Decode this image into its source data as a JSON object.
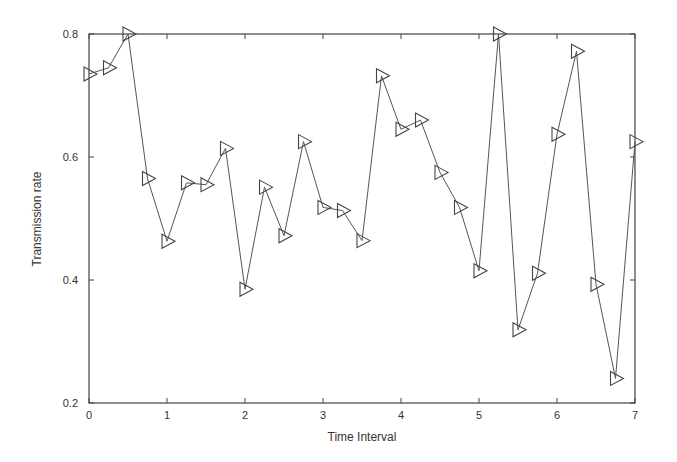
{
  "chart_data": {
    "type": "line",
    "title": "",
    "xlabel": "Time Interval",
    "ylabel": "Transmission rate",
    "xlim": [
      0,
      7
    ],
    "ylim": [
      0.2,
      0.8
    ],
    "xticks": [
      0,
      1,
      2,
      3,
      4,
      5,
      6,
      7
    ],
    "xtick_labels": [
      "0",
      "1",
      "2",
      "3",
      "4",
      "5",
      "6",
      "7"
    ],
    "yticks": [
      0.2,
      0.4,
      0.6,
      0.8
    ],
    "ytick_labels": [
      "0.2",
      "0.4",
      "0.6",
      "0.8"
    ],
    "grid": false,
    "legend": null,
    "marker": "right-pointing triangle (hollow)",
    "line_color": "#555555",
    "series": [
      {
        "name": "Transmission rate",
        "x": [
          0,
          0.25,
          0.5,
          0.75,
          1.0,
          1.25,
          1.5,
          1.75,
          2.0,
          2.25,
          2.5,
          2.75,
          3.0,
          3.25,
          3.5,
          3.75,
          4.0,
          4.25,
          4.5,
          4.75,
          5.0,
          5.25,
          5.5,
          5.75,
          6.0,
          6.25,
          6.5,
          6.75,
          7.0
        ],
        "values": [
          0.735,
          0.745,
          0.8,
          0.565,
          0.463,
          0.558,
          0.555,
          0.614,
          0.385,
          0.551,
          0.472,
          0.625,
          0.518,
          0.513,
          0.464,
          0.732,
          0.645,
          0.66,
          0.575,
          0.518,
          0.415,
          0.8,
          0.319,
          0.411,
          0.637,
          0.772,
          0.393,
          0.24,
          0.625
        ]
      }
    ]
  }
}
